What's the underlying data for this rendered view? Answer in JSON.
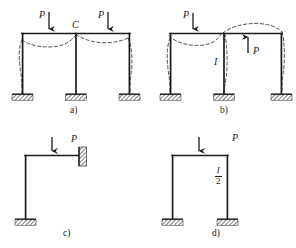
{
  "figure": {
    "type": "structural-frame-diagram",
    "stroke_color": "#1a1a1a",
    "dash_color": "#444444",
    "background": "#ffffff"
  },
  "panels": [
    {
      "id": "a",
      "caption": "a)",
      "kind": "two-bay-portal-frame",
      "loads": [
        {
          "label": "P",
          "direction": "down",
          "bay": "left"
        },
        {
          "label": "P",
          "direction": "down",
          "bay": "right"
        }
      ],
      "joints": [
        {
          "label": "C",
          "position": "mid-top-joint"
        }
      ],
      "supports": [
        "fixed",
        "fixed",
        "fixed"
      ],
      "deflection": "dashed-deflected-shape"
    },
    {
      "id": "b",
      "caption": "b)",
      "kind": "two-bay-portal-frame",
      "loads": [
        {
          "label": "P",
          "direction": "down",
          "bay": "left"
        },
        {
          "label": "P",
          "direction": "up",
          "bay": "right"
        }
      ],
      "members": [
        {
          "label": "I",
          "position": "middle-column"
        }
      ],
      "supports": [
        "fixed",
        "fixed",
        "fixed"
      ],
      "deflection": "dashed-deflected-shape"
    },
    {
      "id": "c",
      "caption": "c)",
      "kind": "L-frame-with-wall",
      "loads": [
        {
          "label": "P",
          "direction": "down",
          "bay": "beam"
        }
      ],
      "supports": [
        "fixed-base",
        "wall-hatch-right"
      ],
      "deflection": "none"
    },
    {
      "id": "d",
      "caption": "d)",
      "kind": "single-bay-portal-frame",
      "loads": [
        {
          "label": "P",
          "direction": "down",
          "bay": "beam"
        }
      ],
      "members": [
        {
          "label_numerator": "I",
          "label_denominator": "2",
          "position": "right-column"
        }
      ],
      "supports": [
        "fixed",
        "fixed"
      ],
      "deflection": "none"
    }
  ],
  "labels": {
    "load_P": "P",
    "joint_C": "C",
    "moment_of_inertia_I": "I",
    "half_I_numerator": "I",
    "half_I_denominator": "2",
    "caption_a": "a)",
    "caption_b": "b)",
    "caption_c": "c)",
    "caption_d": "d)"
  }
}
